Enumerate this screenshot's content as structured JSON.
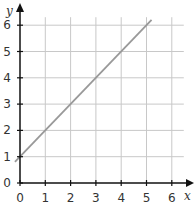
{
  "chart_data": {
    "type": "line",
    "title": "",
    "xlabel": "x",
    "ylabel": "y",
    "xlim": [
      0,
      6
    ],
    "ylim": [
      0,
      6
    ],
    "grid": true,
    "x_ticks": [
      "0",
      "1",
      "2",
      "3",
      "4",
      "5",
      "6"
    ],
    "y_ticks": [
      "0",
      "1",
      "2",
      "3",
      "4",
      "5",
      "6"
    ],
    "series": [
      {
        "name": "y = x + 1",
        "x": [
          -0.2,
          5.2
        ],
        "y": [
          0.8,
          6.2
        ],
        "color": "#999999"
      }
    ]
  },
  "colors": {
    "grid": "#c8c8c8",
    "axis": "#111111",
    "line": "#999999"
  }
}
